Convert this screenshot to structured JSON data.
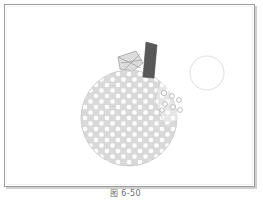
{
  "figure": {
    "caption": "图 6-50",
    "frame": {
      "border_color": "#9b9b9b",
      "shadow_color": "#cfcfcf",
      "background_color": "#ffffff"
    }
  },
  "illustration": {
    "name": "polka-dot-apple-drawing",
    "background_color": "#ffffff",
    "apple_body": {
      "fill_color": "#d9d9d9",
      "outline_color": "#c4c4c4",
      "center_x": 124,
      "center_y": 113,
      "radius_x": 48,
      "radius_y": 48
    },
    "apple_overlay_patch": {
      "fill_color": "#e4e4e4",
      "outline_color": "#c9c9c9"
    },
    "polka_dots": {
      "color": "#ffffff",
      "radius": 2.3,
      "spacing_x": 11,
      "spacing_y": 11,
      "count": 78
    },
    "stem": {
      "fill_color": "#5a5a5a",
      "outline_color": "#4a4a4a",
      "top_x": 146,
      "top_y": 37
    },
    "leaf": {
      "fill_color": "#dcdcdc",
      "outline_color": "#9e9e9e",
      "vein_color": "#8f8f8f"
    },
    "seed_rings": {
      "stroke_color": "#b0b0b0",
      "fill_color": "#ffffff",
      "count": 7
    },
    "empty_circle": {
      "stroke_color": "#dedede",
      "center_x": 202,
      "center_y": 68,
      "radius": 17
    }
  }
}
